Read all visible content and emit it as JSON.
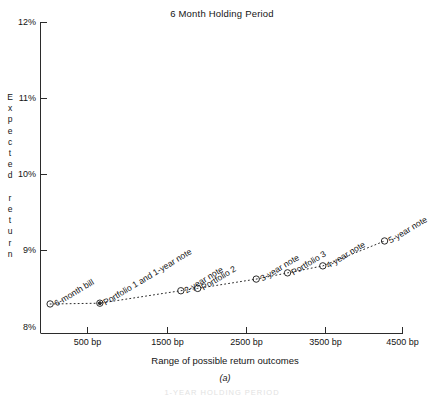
{
  "chart_data": {
    "type": "scatter",
    "title": "6 Month Holding Period",
    "xlabel": "Range of possible return outcomes",
    "ylabel": "Expected return",
    "panel_label": "(a)",
    "xlim": [
      0,
      5000
    ],
    "ylim": [
      8,
      12
    ],
    "x_unit": "bp",
    "xticks": [
      500,
      1500,
      2500,
      3500,
      4500
    ],
    "xtick_labels": [
      "500 bp",
      "1500 bp",
      "2500 bp",
      "3500 bp",
      "4500 bp"
    ],
    "yticks": [
      8,
      9,
      10,
      11,
      12
    ],
    "ytick_labels": [
      "8%",
      "9%",
      "10%",
      "11%",
      "12%"
    ],
    "grid": false,
    "legend": "none",
    "marker": "open-circle",
    "line_style": "dotted",
    "points": [
      {
        "label": "6-month bill",
        "x": 120,
        "y": 8.38,
        "marker": "open-circle"
      },
      {
        "label": "Portfolio 1 and 1-year note",
        "x": 740,
        "y": 8.39,
        "marker": "double-circle"
      },
      {
        "label": "2-year note",
        "x": 1750,
        "y": 8.55,
        "marker": "open-circle"
      },
      {
        "label": "Portfolio 2",
        "x": 1960,
        "y": 8.58,
        "marker": "open-circle"
      },
      {
        "label": "3-year note",
        "x": 2690,
        "y": 8.7,
        "marker": "open-circle"
      },
      {
        "label": "Portfolio 3",
        "x": 3080,
        "y": 8.78,
        "marker": "open-circle"
      },
      {
        "label": "4-year note",
        "x": 3520,
        "y": 8.87,
        "marker": "open-circle"
      },
      {
        "label": "5-year note",
        "x": 4290,
        "y": 9.19,
        "marker": "open-circle"
      }
    ]
  },
  "axis": {
    "ylabel_letters": [
      "E",
      "x",
      "p",
      "e",
      "c",
      "t",
      "e",
      "d",
      "",
      "r",
      "e",
      "t",
      "u",
      "r",
      "n"
    ],
    "ytick_labels": [
      "12%",
      "11%",
      "10%",
      "9%",
      "8%"
    ],
    "xtick_labels": [
      "500 bp",
      "1500 bp",
      "2500 bp",
      "3500 bp",
      "4500 bp"
    ]
  },
  "title": "6 Month Holding Period",
  "xaxis_title": "Range of possible return outcomes",
  "panel_label": "(a)",
  "bottom_ghost": "1-YEAR HOLDING PERIOD",
  "labels": {
    "p0": "6-month bill",
    "p1": "Portfolio 1 and 1-year note",
    "p2": "2-year note",
    "p3": "Portfolio 2",
    "p4": "3-year note",
    "p5": "Portfolio 3",
    "p6": "4-year note",
    "p7": "5-year note"
  }
}
